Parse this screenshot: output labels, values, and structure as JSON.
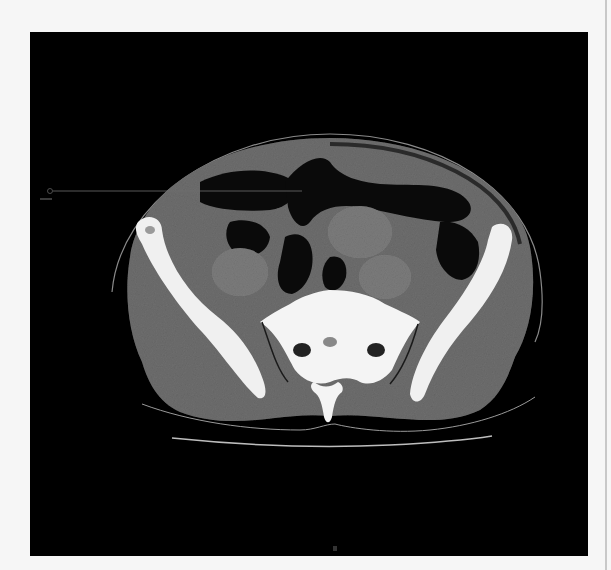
{
  "image": {
    "kind": "axial CT scan, pelvis (soft tissue window)",
    "panel_background": "#000000",
    "page_background": "#f6f6f6",
    "colors": {
      "soft_tissue": "#6e6e6e",
      "bone": "#f2f2f2",
      "bowel_gas": "#0a0a0a",
      "annotation_line": "#707070",
      "table": "#bdbdbd"
    }
  },
  "annotation": {
    "type": "pointer-line",
    "label": ""
  }
}
